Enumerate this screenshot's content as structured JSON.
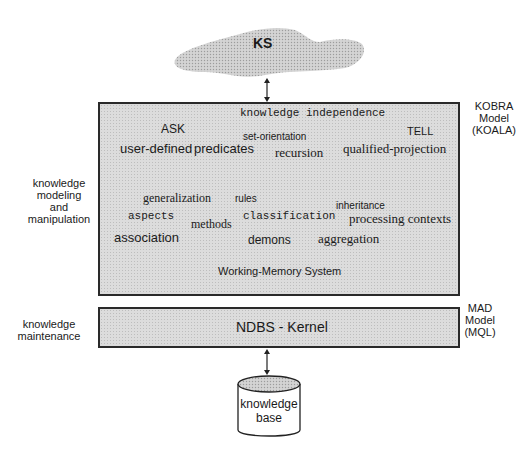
{
  "cloud": {
    "label": "KS"
  },
  "main_box": {
    "terms": [
      {
        "text": "knowledge independence",
        "font": "mono",
        "x": 240,
        "y": 107,
        "size": 11
      },
      {
        "text": "ASK",
        "font": "sans",
        "x": 161,
        "y": 122,
        "size": 12
      },
      {
        "text": "TELL",
        "font": "sans",
        "x": 407,
        "y": 125,
        "size": 11
      },
      {
        "text": "set-orientation",
        "font": "sans",
        "x": 243,
        "y": 131,
        "size": 10
      },
      {
        "text": "user-defined",
        "font": "sans",
        "x": 120,
        "y": 141,
        "size": 13
      },
      {
        "text": "predicates",
        "font": "sans",
        "x": 194,
        "y": 141,
        "size": 13
      },
      {
        "text": "recursion",
        "font": "serif",
        "x": 275,
        "y": 145,
        "size": 13
      },
      {
        "text": "qualified-projection",
        "font": "serif",
        "x": 343,
        "y": 141,
        "size": 13
      },
      {
        "text": "generalization",
        "font": "serif",
        "x": 143,
        "y": 191,
        "size": 12
      },
      {
        "text": "rules",
        "font": "sans",
        "x": 235,
        "y": 193,
        "size": 10
      },
      {
        "text": "inheritance",
        "font": "sans",
        "x": 336,
        "y": 200,
        "size": 10
      },
      {
        "text": "aspects",
        "font": "mono",
        "x": 128,
        "y": 210,
        "size": 11
      },
      {
        "text": "methods",
        "font": "serif",
        "x": 191,
        "y": 217,
        "size": 12
      },
      {
        "text": "classification",
        "font": "mono",
        "x": 243,
        "y": 210,
        "size": 11
      },
      {
        "text": "processing contexts",
        "font": "serif",
        "x": 349,
        "y": 211,
        "size": 13
      },
      {
        "text": "association",
        "font": "sans",
        "x": 114,
        "y": 230,
        "size": 13
      },
      {
        "text": "demons",
        "font": "sans",
        "x": 248,
        "y": 233,
        "size": 12
      },
      {
        "text": "aggregation",
        "font": "serif",
        "x": 318,
        "y": 231,
        "size": 13
      },
      {
        "text": "Working-Memory  System",
        "font": "sans",
        "x": 218,
        "y": 265,
        "size": 11
      }
    ]
  },
  "kernel_box": {
    "label": "NDBS - Kernel"
  },
  "database": {
    "line1": "knowledge",
    "line2": "base"
  },
  "left_labels": {
    "modeling": [
      "knowledge",
      "modeling",
      "and",
      "manipulation"
    ],
    "maintenance": [
      "knowledge",
      "maintenance"
    ]
  },
  "right_labels": {
    "kobra": [
      "KOBRA",
      "Model",
      "(KOALA)"
    ],
    "mad": [
      "MAD",
      "Model",
      "(MQL)"
    ]
  }
}
